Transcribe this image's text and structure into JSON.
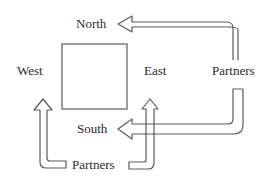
{
  "diagram": {
    "labels": {
      "north": "North",
      "south": "South",
      "east": "East",
      "west": "West",
      "partners_right": "Partners",
      "partners_bottom": "Partners"
    },
    "colors": {
      "stroke": "#5a5a5a",
      "text": "#2a2a2a",
      "background": "#ffffff"
    }
  }
}
